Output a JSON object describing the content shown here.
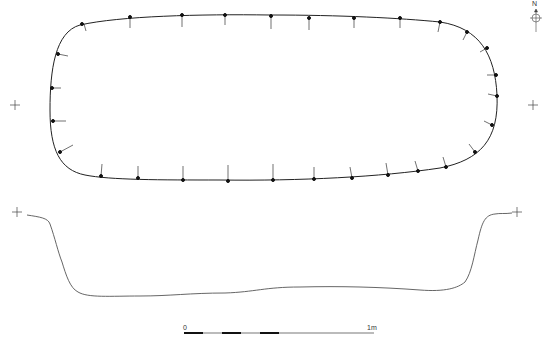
{
  "drawing": {
    "type": "archaeological feature plan and section",
    "plan_view": {
      "shape": "rounded oblong pit outline with hachures",
      "hachure_count": 34
    },
    "section_view": {
      "shape": "profile of pit cut"
    },
    "north_arrow": {
      "label": "N"
    },
    "scale_bar": {
      "start_label": "0",
      "end_label": "1m",
      "segments": 10
    },
    "registration_crosses": 4,
    "colors": {
      "line": "#222222",
      "section_line": "#555555",
      "background": "#ffffff"
    }
  }
}
